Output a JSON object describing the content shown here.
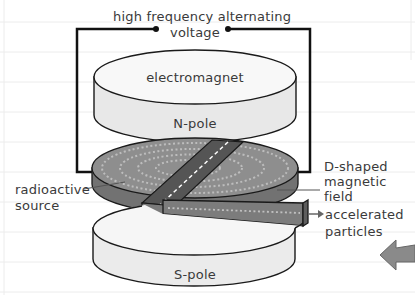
{
  "diagram": {
    "type": "cyclotron",
    "labels": {
      "voltage_line1": "high frequency alternating",
      "voltage_line2": "voltage",
      "electromagnet": "electromagnet",
      "north_pole": "N-pole",
      "south_pole": "S-pole",
      "dee_line1": "D-shaped",
      "dee_line2": "magnetic",
      "dee_line3": "field",
      "source_line1": "radioactive",
      "source_line2": "source",
      "output_line1": "accelerated",
      "output_line2": "particles"
    },
    "colors": {
      "background": "#ffffff",
      "rule_lines": "#ececec",
      "outline": "#1a1a1a",
      "magnet_face": "#f7f7f7",
      "magnet_side": "#e6e6e6",
      "dee_top": "#8c8c8c",
      "dee_side": "#6e6e6e",
      "dots": "#b5b5b5",
      "text": "#3a3a3a",
      "nav_arrow": "#8a8a8a"
    }
  }
}
